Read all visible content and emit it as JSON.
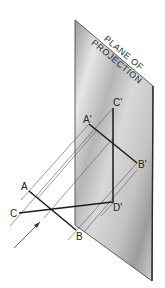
{
  "figure": {
    "plane_label_line1": "PLANE OF",
    "plane_label_line2": "PROJECTION",
    "points": {
      "A": "A",
      "B": "B",
      "C": "C",
      "A_proj": "A'",
      "B_proj": "B'",
      "C_proj": "C'",
      "D_proj": "D'"
    },
    "colors": {
      "plane_light": "#e2e2e2",
      "plane_dark": "#8e8e8e",
      "plane_edge": "#3a3a3a",
      "line": "#1a1a1a",
      "projector": "#555555"
    }
  }
}
